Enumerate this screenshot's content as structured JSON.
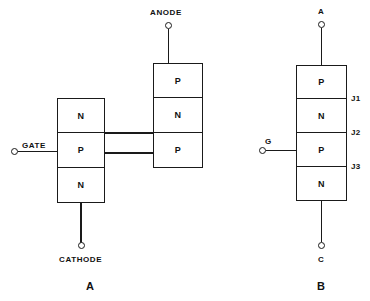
{
  "figure": {
    "caption_a": "A",
    "caption_b": "B"
  },
  "diagram_a": {
    "name": "two-transistor-equivalent-thyristor",
    "terminals": {
      "anode": "ANODE",
      "gate": "GATE",
      "cathode": "CATHODE"
    },
    "left_stack": {
      "layers": [
        "N",
        "P",
        "N"
      ]
    },
    "right_stack": {
      "layers": [
        "P",
        "N",
        "P"
      ]
    }
  },
  "diagram_b": {
    "name": "four-layer-pnpn-structure",
    "terminals": {
      "anode": "A",
      "gate": "G",
      "cathode": "C"
    },
    "layers": [
      "P",
      "N",
      "P",
      "N"
    ],
    "junctions": [
      "J1",
      "J2",
      "J3"
    ]
  },
  "colors": {
    "line": "#1a1a1a",
    "fill": "#ffffff",
    "text": "#111111"
  }
}
